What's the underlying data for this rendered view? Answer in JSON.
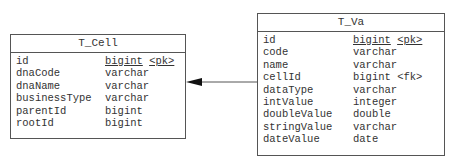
{
  "entities": {
    "cell": {
      "name": "T_Cell",
      "columns": [
        {
          "name": "id",
          "type": "bigint",
          "key": "<pk>"
        },
        {
          "name": "dnaCode",
          "type": "varchar",
          "key": ""
        },
        {
          "name": "dnaName",
          "type": "varchar",
          "key": ""
        },
        {
          "name": "businessType",
          "type": "varchar",
          "key": ""
        },
        {
          "name": "parentId",
          "type": "bigint",
          "key": ""
        },
        {
          "name": "rootId",
          "type": "bigint",
          "key": ""
        }
      ]
    },
    "va": {
      "name": "T_Va",
      "columns": [
        {
          "name": "id",
          "type": "bigint",
          "key": "<pk>"
        },
        {
          "name": "code",
          "type": "varchar",
          "key": ""
        },
        {
          "name": "name",
          "type": "varchar",
          "key": ""
        },
        {
          "name": "cellId",
          "type": "bigint",
          "key": "<fk>"
        },
        {
          "name": "dataType",
          "type": "varchar",
          "key": ""
        },
        {
          "name": "intValue",
          "type": "integer",
          "key": ""
        },
        {
          "name": "doubleValue",
          "type": "double",
          "key": ""
        },
        {
          "name": "stringValue",
          "type": "varchar",
          "key": ""
        },
        {
          "name": "dateValue",
          "type": "date",
          "key": ""
        }
      ]
    }
  },
  "relationship": {
    "from": "T_Va.cellId",
    "to": "T_Cell.id",
    "arrow": "filled-triangle",
    "color": "#555555"
  }
}
